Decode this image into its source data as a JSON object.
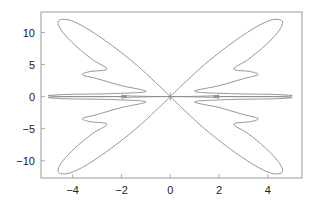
{
  "chart_data": {
    "type": "line",
    "title": "",
    "xlabel": "",
    "ylabel": "",
    "xlim": [
      -5.3,
      5.4
    ],
    "ylim": [
      -12.7,
      13.2
    ],
    "x_ticks": [
      -4,
      -2,
      0,
      2,
      4
    ],
    "x_tick_labels": [
      "−4",
      "−2",
      "0",
      "2",
      "4"
    ],
    "y_ticks": [
      10,
      5,
      0,
      -5,
      -10
    ],
    "y_tick_labels": [
      "10",
      "5",
      "0",
      "−5",
      "−10"
    ],
    "grid": false,
    "legend": "none",
    "series": [
      {
        "name": "parametric curve",
        "color": "#8a8a8a",
        "description": "butterfly-shaped closed curve: four large lobes toward (±4.4, ±12), notches near (±3.5, ±3.5), thin horizontal lobes to x≈±5 at y≈0",
        "key_points": [
          {
            "x": 0,
            "y": 0
          },
          {
            "x": -4.4,
            "y": 12.2
          },
          {
            "x": -3.5,
            "y": 3.5
          },
          {
            "x": -5.0,
            "y": 0.2
          },
          {
            "x": 4.5,
            "y": 12.0
          },
          {
            "x": 3.6,
            "y": 3.4
          },
          {
            "x": 5.0,
            "y": 0.1
          },
          {
            "x": -4.5,
            "y": -12.0
          },
          {
            "x": 4.4,
            "y": -12.2
          }
        ]
      }
    ]
  }
}
